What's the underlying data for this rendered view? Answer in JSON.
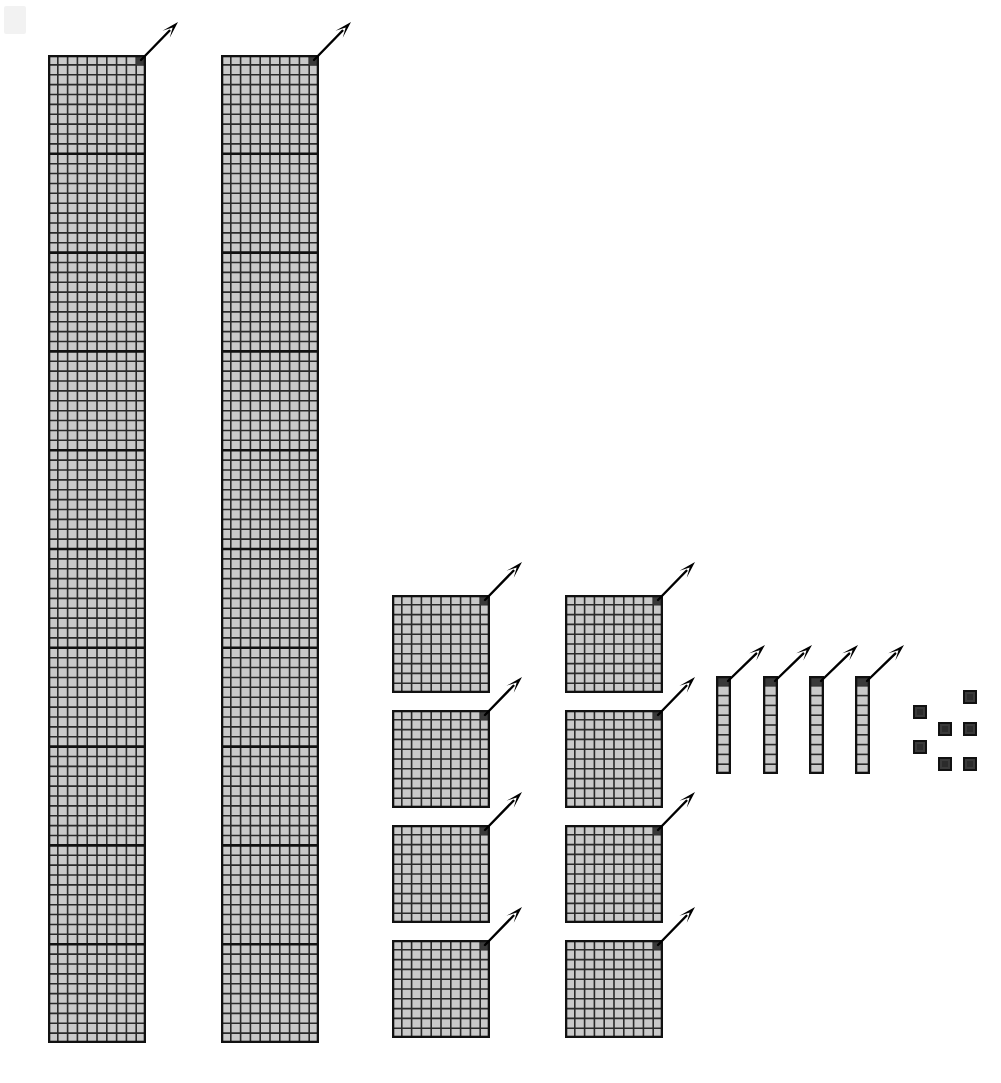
{
  "diagram": {
    "title": "Base-ten place value block diagram",
    "type": "place-value-blocks",
    "canvas": {
      "width": 1001,
      "height": 1083,
      "background": "#ffffff"
    },
    "colors": {
      "cell_fill": "#c9c9c9",
      "cell_line": "#2a2a2a",
      "major_line": "#111111",
      "outline": "#111111",
      "highlight_cell": "#3a3a3a",
      "arrow": "#000000",
      "watermark": "#f2f2f2"
    },
    "cell_size_px": 9.8,
    "legend": {
      "thousand_column_label": "thousand-column",
      "hundred_square_label": "hundred-square",
      "ten_bar_label": "ten-bar",
      "unit_label": "unit"
    },
    "groups": [
      {
        "name": "thousand-column-1",
        "kind": "column",
        "cols": 10,
        "rows": 100,
        "count": 1000,
        "x": 48,
        "y": 55,
        "w": 98,
        "h": 988,
        "major_every": 10,
        "arrow": {
          "from_x": 141,
          "from_y": 60,
          "to_x": 178,
          "to_y": 22
        }
      },
      {
        "name": "thousand-column-2",
        "kind": "column",
        "cols": 10,
        "rows": 100,
        "count": 1000,
        "x": 221,
        "y": 55,
        "w": 98,
        "h": 988,
        "major_every": 10,
        "arrow": {
          "from_x": 314,
          "from_y": 60,
          "to_x": 351,
          "to_y": 22
        }
      },
      {
        "name": "hundred-square-1",
        "kind": "square",
        "cols": 10,
        "rows": 10,
        "count": 100,
        "x": 392,
        "y": 595,
        "w": 98,
        "h": 98,
        "major_every": 10,
        "arrow": {
          "from_x": 485,
          "from_y": 600,
          "to_x": 522,
          "to_y": 562
        }
      },
      {
        "name": "hundred-square-2",
        "kind": "square",
        "cols": 10,
        "rows": 10,
        "count": 100,
        "x": 392,
        "y": 710,
        "w": 98,
        "h": 98,
        "major_every": 10,
        "arrow": {
          "from_x": 485,
          "from_y": 715,
          "to_x": 522,
          "to_y": 677
        }
      },
      {
        "name": "hundred-square-3",
        "kind": "square",
        "cols": 10,
        "rows": 10,
        "count": 100,
        "x": 392,
        "y": 825,
        "w": 98,
        "h": 98,
        "major_every": 10,
        "arrow": {
          "from_x": 485,
          "from_y": 830,
          "to_x": 522,
          "to_y": 792
        }
      },
      {
        "name": "hundred-square-4",
        "kind": "square",
        "cols": 10,
        "rows": 10,
        "count": 100,
        "x": 392,
        "y": 940,
        "w": 98,
        "h": 98,
        "major_every": 10,
        "arrow": {
          "from_x": 485,
          "from_y": 945,
          "to_x": 522,
          "to_y": 907
        }
      },
      {
        "name": "hundred-square-5",
        "kind": "square",
        "cols": 10,
        "rows": 10,
        "count": 100,
        "x": 565,
        "y": 595,
        "w": 98,
        "h": 98,
        "major_every": 10,
        "arrow": {
          "from_x": 658,
          "from_y": 600,
          "to_x": 695,
          "to_y": 562
        }
      },
      {
        "name": "hundred-square-6",
        "kind": "square",
        "cols": 10,
        "rows": 10,
        "count": 100,
        "x": 565,
        "y": 710,
        "w": 98,
        "h": 98,
        "major_every": 10,
        "arrow": {
          "from_x": 658,
          "from_y": 715,
          "to_x": 695,
          "to_y": 677
        }
      },
      {
        "name": "hundred-square-7",
        "kind": "square",
        "cols": 10,
        "rows": 10,
        "count": 100,
        "x": 565,
        "y": 825,
        "w": 98,
        "h": 98,
        "major_every": 10,
        "arrow": {
          "from_x": 658,
          "from_y": 830,
          "to_x": 695,
          "to_y": 792
        }
      },
      {
        "name": "hundred-square-8",
        "kind": "square",
        "cols": 10,
        "rows": 10,
        "count": 100,
        "x": 565,
        "y": 940,
        "w": 98,
        "h": 98,
        "major_every": 10,
        "arrow": {
          "from_x": 658,
          "from_y": 945,
          "to_x": 695,
          "to_y": 907
        }
      },
      {
        "name": "ten-bar-1",
        "kind": "bar",
        "cols": 1,
        "rows": 10,
        "count": 10,
        "x": 716,
        "y": 676,
        "w": 15,
        "h": 98,
        "major_every": 10,
        "arrow": {
          "from_x": 728,
          "from_y": 681,
          "to_x": 765,
          "to_y": 645
        }
      },
      {
        "name": "ten-bar-2",
        "kind": "bar",
        "cols": 1,
        "rows": 10,
        "count": 10,
        "x": 763,
        "y": 676,
        "w": 15,
        "h": 98,
        "major_every": 10,
        "arrow": {
          "from_x": 775,
          "from_y": 681,
          "to_x": 812,
          "to_y": 645
        }
      },
      {
        "name": "ten-bar-3",
        "kind": "bar",
        "cols": 1,
        "rows": 10,
        "count": 10,
        "x": 809,
        "y": 676,
        "w": 15,
        "h": 98,
        "major_every": 10,
        "arrow": {
          "from_x": 821,
          "from_y": 681,
          "to_x": 858,
          "to_y": 645
        }
      },
      {
        "name": "ten-bar-4",
        "kind": "bar",
        "cols": 1,
        "rows": 10,
        "count": 10,
        "x": 855,
        "y": 676,
        "w": 15,
        "h": 98,
        "major_every": 10,
        "arrow": {
          "from_x": 867,
          "from_y": 681,
          "to_x": 904,
          "to_y": 645
        }
      }
    ],
    "units": [
      {
        "name": "unit-1",
        "x": 963,
        "y": 690,
        "size": 14
      },
      {
        "name": "unit-2",
        "x": 913,
        "y": 705,
        "size": 14
      },
      {
        "name": "unit-3",
        "x": 938,
        "y": 722,
        "size": 14
      },
      {
        "name": "unit-4",
        "x": 963,
        "y": 722,
        "size": 14
      },
      {
        "name": "unit-5",
        "x": 913,
        "y": 740,
        "size": 14
      },
      {
        "name": "unit-6",
        "x": 938,
        "y": 757,
        "size": 14
      },
      {
        "name": "unit-7",
        "x": 963,
        "y": 757,
        "size": 14
      }
    ],
    "watermark": {
      "x": 4,
      "y": 6,
      "w": 22,
      "h": 28
    },
    "totals": {
      "thousands": 2,
      "hundreds": 8,
      "tens": 4,
      "ones": 7,
      "value": 2847
    }
  }
}
